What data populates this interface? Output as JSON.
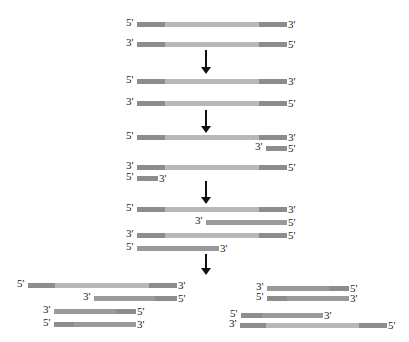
{
  "colors": {
    "primer_region": "#8c8c8c",
    "template_middle": "#b8b8b8",
    "new_strand_middle": "#9a9a9a",
    "arrow": "#111111",
    "label": "#222222"
  },
  "stages": [
    {
      "name": "original-dsDNA",
      "strands": [
        {
          "x": 137,
          "y": 22,
          "w": 150,
          "left_label": "5'",
          "right_label": "3'",
          "segs": [
            [
              "p",
              28
            ],
            [
              "t",
              94
            ],
            [
              "p",
              28
            ]
          ]
        },
        {
          "x": 137,
          "y": 42,
          "w": 150,
          "left_label": "3'",
          "right_label": "5'",
          "segs": [
            [
              "p",
              28
            ],
            [
              "t",
              94
            ],
            [
              "p",
              28
            ]
          ]
        }
      ]
    },
    {
      "name": "denatured",
      "strands": [
        {
          "x": 137,
          "y": 79,
          "w": 150,
          "left_label": "5'",
          "right_label": "3'",
          "segs": [
            [
              "p",
              28
            ],
            [
              "t",
              94
            ],
            [
              "p",
              28
            ]
          ]
        },
        {
          "x": 137,
          "y": 101,
          "w": 150,
          "left_label": "3'",
          "right_label": "5'",
          "segs": [
            [
              "p",
              28
            ],
            [
              "t",
              94
            ],
            [
              "p",
              28
            ]
          ]
        }
      ]
    },
    {
      "name": "primer-annealing",
      "strands": [
        {
          "x": 137,
          "y": 135,
          "w": 150,
          "left_label": "5'",
          "right_label": "3'",
          "segs": [
            [
              "p",
              28
            ],
            [
              "t",
              94
            ],
            [
              "p",
              28
            ]
          ]
        },
        {
          "x": 266,
          "y": 146,
          "w": 21,
          "left_label": "3'",
          "right_label": "5'",
          "segs": [
            [
              "p",
              21
            ]
          ]
        },
        {
          "x": 137,
          "y": 165,
          "w": 150,
          "left_label": "3'",
          "right_label": "5'",
          "segs": [
            [
              "p",
              28
            ],
            [
              "t",
              94
            ],
            [
              "p",
              28
            ]
          ]
        },
        {
          "x": 137,
          "y": 176,
          "w": 21,
          "left_label": "5'",
          "right_label": "3'",
          "segs": [
            [
              "p",
              21
            ]
          ]
        }
      ]
    },
    {
      "name": "extension",
      "strands": [
        {
          "x": 137,
          "y": 207,
          "w": 150,
          "left_label": "5'",
          "right_label": "3'",
          "segs": [
            [
              "p",
              28
            ],
            [
              "t",
              94
            ],
            [
              "p",
              28
            ]
          ]
        },
        {
          "x": 206,
          "y": 220,
          "w": 81,
          "left_label": "3'",
          "right_label": "5'",
          "segs": [
            [
              "n",
              81
            ]
          ]
        },
        {
          "x": 137,
          "y": 233,
          "w": 150,
          "left_label": "3'",
          "right_label": "5'",
          "segs": [
            [
              "p",
              28
            ],
            [
              "t",
              94
            ],
            [
              "p",
              28
            ]
          ]
        },
        {
          "x": 137,
          "y": 246,
          "w": 82,
          "left_label": "5'",
          "right_label": "3'",
          "segs": [
            [
              "n",
              82
            ]
          ]
        }
      ]
    },
    {
      "name": "second-cycle-products-left",
      "strands": [
        {
          "x": 28,
          "y": 283,
          "w": 149,
          "left_label": "5'",
          "right_label": "3'",
          "segs": [
            [
              "p",
              27
            ],
            [
              "t",
              94
            ],
            [
              "p",
              28
            ]
          ]
        },
        {
          "x": 94,
          "y": 296,
          "w": 83,
          "left_label": "3'",
          "right_label": "5'",
          "segs": [
            [
              "n",
              61
            ],
            [
              "p",
              22
            ]
          ]
        },
        {
          "x": 54,
          "y": 309,
          "w": 82,
          "left_label": "3'",
          "right_label": "5'",
          "segs": [
            [
              "n",
              62
            ],
            [
              "p",
              20
            ]
          ]
        },
        {
          "x": 54,
          "y": 322,
          "w": 82,
          "left_label": "5'",
          "right_label": "3'",
          "segs": [
            [
              "p",
              20
            ],
            [
              "n",
              62
            ]
          ]
        }
      ]
    },
    {
      "name": "second-cycle-products-right",
      "strands": [
        {
          "x": 267,
          "y": 286,
          "w": 82,
          "left_label": "3'",
          "right_label": "5'",
          "segs": [
            [
              "n",
              62
            ],
            [
              "p",
              20
            ]
          ]
        },
        {
          "x": 267,
          "y": 296,
          "w": 82,
          "left_label": "5'",
          "right_label": "3'",
          "segs": [
            [
              "p",
              20
            ],
            [
              "n",
              62
            ]
          ]
        },
        {
          "x": 241,
          "y": 313,
          "w": 82,
          "left_label": "5'",
          "right_label": "3'",
          "segs": [
            [
              "p",
              21
            ],
            [
              "n",
              61
            ]
          ]
        },
        {
          "x": 240,
          "y": 323,
          "w": 147,
          "left_label": "3'",
          "right_label": "5'",
          "segs": [
            [
              "p",
              26
            ],
            [
              "t",
              93
            ],
            [
              "p",
              28
            ]
          ]
        }
      ]
    }
  ],
  "arrows": [
    {
      "x": 205,
      "y": 50,
      "len": 18
    },
    {
      "x": 205,
      "y": 110,
      "len": 17
    },
    {
      "x": 205,
      "y": 181,
      "len": 17
    },
    {
      "x": 205,
      "y": 254,
      "len": 15
    }
  ]
}
